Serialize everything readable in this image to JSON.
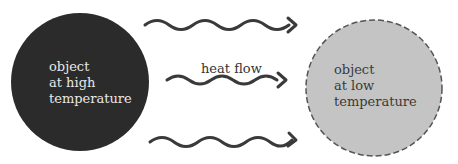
{
  "diagram": {
    "hot_object": {
      "lines": [
        "object",
        "at high",
        "temperature"
      ],
      "fill": "#2b2b2b"
    },
    "cold_object": {
      "lines": [
        "object",
        "at low",
        "temperature"
      ],
      "fill": "#c4c4c4",
      "stroke": "#555555"
    },
    "flow_label": "heat flow",
    "arrow_color": "#3a3a3a",
    "arrow_count": 3
  }
}
